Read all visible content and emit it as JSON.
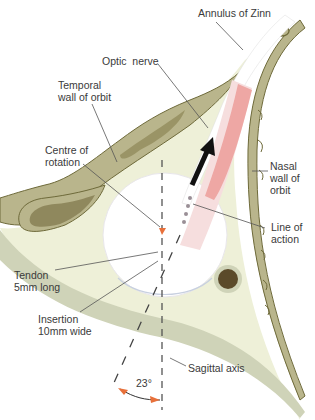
{
  "figure": {
    "labels": {
      "annulus": "Annulus of Zinn",
      "optic_nerve": "Optic  nerve",
      "temporal_wall": "Temporal\nwall of orbit",
      "centre_rotation": "Centre of\nrotation",
      "nasal_wall": "Nasal\nwall of\norbit",
      "line_action": "Line of\naction",
      "tendon": "Tendon\n5mm long",
      "insertion": "Insertion\n10mm wide",
      "sagittal": "Sagittal axis",
      "angle": "23°"
    },
    "colors": {
      "bone": "#b9b58c",
      "bone_outline": "#6e6a3a",
      "orbit_fat": "#eef0d8",
      "muscle": "#eea7a4",
      "muscle_sheath": "#f6dede",
      "globe": "#ffffff",
      "arrow": "#111111",
      "angle_arrow": "#e8703a",
      "lacrimal_gland": "#5b4a2a",
      "text": "#3a3a3a",
      "leader_line": "#555555"
    }
  }
}
